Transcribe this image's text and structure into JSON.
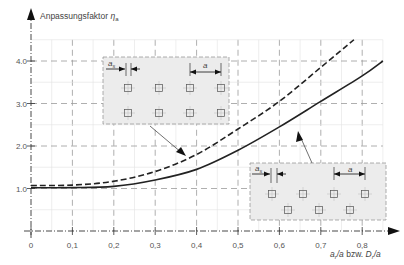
{
  "chart_data": {
    "type": "line",
    "title": "",
    "ylabel": "Anpassungsfaktor η_a",
    "ylabel_main": "Anpassungsfaktor ",
    "ylabel_symbol": "η",
    "ylabel_sub": "a",
    "xlabel": "a_r/a bzw. D_r/a",
    "xlabel_parts": {
      "a": "a",
      "sub1": "r",
      "mid": "/a bzw. ",
      "D": "D",
      "sub2": "r",
      "end": "/a"
    },
    "xlim": [
      0,
      0.85
    ],
    "ylim": [
      0,
      4.5
    ],
    "x_ticks": [
      "0",
      "0,1",
      "0,2",
      "0,3",
      "0,4",
      "0,5",
      "0,6",
      "0,7",
      "0,8"
    ],
    "y_ticks": [
      "1,0",
      "2,0",
      "3,0",
      "4,0"
    ],
    "y_ticks_display": [
      "1.0",
      "2.0",
      "3.0",
      "4.0"
    ],
    "grid": true,
    "legend": null,
    "series": [
      {
        "name": "Rechteckiges Raster (parallele Anordnung)",
        "style": "dashed",
        "x": [
          0,
          0.1,
          0.2,
          0.3,
          0.4,
          0.5,
          0.6,
          0.7,
          0.78
        ],
        "values": [
          1.07,
          1.08,
          1.17,
          1.4,
          1.8,
          2.4,
          3.05,
          3.85,
          4.5
        ]
      },
      {
        "name": "Versetztes Raster",
        "style": "solid",
        "x": [
          0,
          0.1,
          0.2,
          0.3,
          0.4,
          0.5,
          0.6,
          0.7,
          0.8,
          0.85
        ],
        "values": [
          1.02,
          1.02,
          1.05,
          1.2,
          1.45,
          1.9,
          2.45,
          3.05,
          3.65,
          4.0
        ]
      }
    ],
    "annotations": [
      {
        "type": "inset",
        "label_spacing": "a",
        "label_edge": "a",
        "label_edge_sub": "s",
        "arrangement": "aligned 2x4 grid",
        "points_to": "dashed"
      },
      {
        "type": "inset",
        "label_spacing": "a",
        "label_edge": "a",
        "label_edge_sub": "s",
        "arrangement": "staggered 4+3 grid",
        "points_to": "solid"
      }
    ]
  },
  "colors": {
    "curve": "#222222",
    "grid": "#9a9a9a",
    "inset_fill": "#ececec",
    "inset_border": "#9a9a9a",
    "axis": "#333333"
  }
}
